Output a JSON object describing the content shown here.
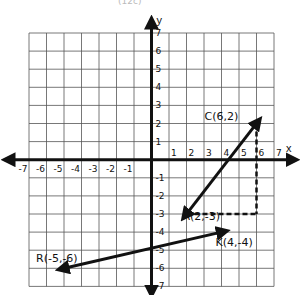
{
  "caption": "(12c)",
  "axes": {
    "x_label": "x",
    "y_label": "y",
    "x_ticks": [
      "-7",
      "-6",
      "-5",
      "-4",
      "-3",
      "-2",
      "-1",
      "1",
      "2",
      "3",
      "4",
      "5",
      "6",
      "7"
    ],
    "y_ticks": [
      "7",
      "6",
      "5",
      "4",
      "3",
      "2",
      "1",
      "-1",
      "-2",
      "-3",
      "-4",
      "-5",
      "-6",
      "-7"
    ],
    "x_range": [
      -7,
      7
    ],
    "y_range": [
      -7,
      7
    ]
  },
  "points": {
    "C": {
      "label": "C(6,2)",
      "x": 6,
      "y": 2
    },
    "A": {
      "label": "A(2,-3)",
      "x": 2,
      "y": -3
    },
    "K": {
      "label": "K(4,-4)",
      "x": 4,
      "y": -4
    },
    "R": {
      "label": "R(-5,-6)",
      "x": -5,
      "y": -6
    }
  },
  "vectors": [
    {
      "from": "C",
      "to": "A",
      "style": "solid-arrow-both"
    },
    {
      "from": "R",
      "to": "K",
      "style": "solid-arrow-both"
    }
  ],
  "dashed_guides": [
    {
      "from": [
        6,
        2
      ],
      "to": [
        6,
        -3
      ]
    },
    {
      "from": [
        2,
        -3
      ],
      "to": [
        6,
        -3
      ]
    }
  ],
  "colors": {
    "grid": "#555555",
    "axis": "#111111",
    "ink": "#111111",
    "background": "#ffffff"
  }
}
